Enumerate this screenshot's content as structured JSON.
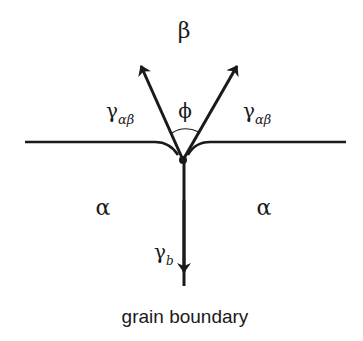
{
  "diagram": {
    "phase_top": "β",
    "phase_left": "α",
    "phase_right": "α",
    "angle_label": "ϕ",
    "tension_left": {
      "symbol": "γ",
      "subscript": "αβ"
    },
    "tension_right": {
      "symbol": "γ",
      "subscript": "αβ"
    },
    "tension_bottom": {
      "symbol": "γ",
      "subscript": "b"
    },
    "caption": "grain boundary",
    "line_color": "#1a1a1a"
  }
}
